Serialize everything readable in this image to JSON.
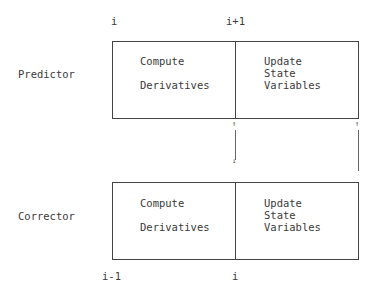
{
  "diagram": {
    "type": "predictor-corrector timing diagram",
    "predictor": {
      "label": "Predictor",
      "top_ticks": {
        "left": "i",
        "middle": "i+1"
      },
      "left_cell": {
        "line1": "Compute",
        "line2": "Derivatives"
      },
      "right_cell": {
        "line1": "Update",
        "line2": "State",
        "line3": "Variables"
      }
    },
    "corrector": {
      "label": "Corrector",
      "bottom_ticks": {
        "left": "i-1",
        "middle": "i"
      },
      "left_cell": {
        "line1": "Compute",
        "line2": "Derivatives"
      },
      "right_cell": {
        "line1": "Update",
        "line2": "State",
        "line3": "Variables"
      }
    },
    "connectors": {
      "middle": "bidirectional arrow between predictor and corrector at middle boundary",
      "right": "up arrow from corrector right edge to predictor right edge"
    },
    "arrow_up_glyph": "↑",
    "arrow_down_glyph": "↓",
    "colors": {
      "line": "#444444",
      "text": "#3a3a3a",
      "background": "#ffffff"
    }
  }
}
